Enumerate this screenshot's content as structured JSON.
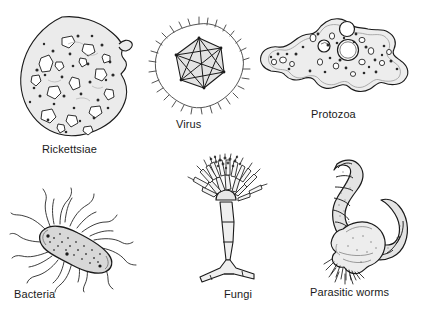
{
  "figure": {
    "background_color": "#ffffff",
    "line_color": "#1a1a1a",
    "fill_color": "#e9e9e9",
    "label_color": "#1a1a1a",
    "layout": "2 rows x 3 columns"
  },
  "organisms": [
    {
      "id": "rickettsiae",
      "label": "Rickettsiae",
      "icon": "rickettsiae-cell-icon",
      "row": 1,
      "column": 1,
      "description": "Irregular rounded cell with many small dark inclusions"
    },
    {
      "id": "virus",
      "label": "Virus",
      "icon": "virus-icosahedron-icon",
      "row": 1,
      "column": 2,
      "description": "Icosahedral capsid inside a spiked envelope"
    },
    {
      "id": "protozoa",
      "label": "Protozoa",
      "icon": "protozoa-amoeba-icon",
      "row": 1,
      "column": 3,
      "description": "Amoeba with pseudopods, nucleus and vacuoles"
    },
    {
      "id": "bacteria",
      "label": "Bacteria",
      "icon": "bacteria-bacillus-icon",
      "row": 2,
      "column": 1,
      "description": "Rod-shaped bacillus with peritrichous flagella"
    },
    {
      "id": "fungi",
      "label": "Fungi",
      "icon": "fungi-conidiophore-icon",
      "row": 2,
      "column": 2,
      "description": "Conidiophore with brush-like phialides on a branched stalk"
    },
    {
      "id": "parasitic-worms",
      "label": "Parasitic worms",
      "icon": "parasitic-worm-icon",
      "row": 2,
      "column": 3,
      "description": "Segmented curved worm with a bulbous bristled head"
    }
  ]
}
